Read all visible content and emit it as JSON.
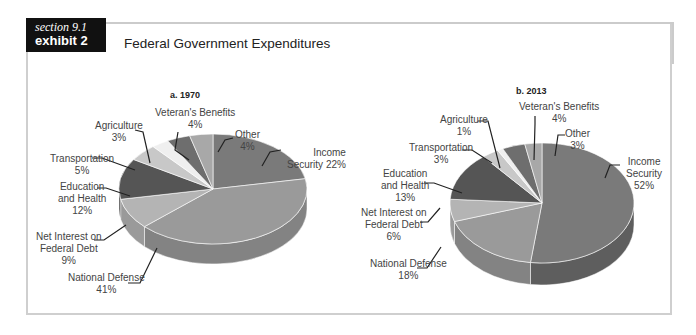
{
  "header": {
    "section": "section 9.1",
    "exhibit": "exhibit 2",
    "title": "Federal Government Expenditures"
  },
  "colors": {
    "header_band": "#cbcbcb",
    "tag_bg": "#111111",
    "frame_border": "#cfcfcf"
  },
  "chart_data": [
    {
      "type": "pie",
      "title": "a. 1970",
      "slices": [
        {
          "label": "Income Security",
          "value": 22,
          "text": "Income Security 22%"
        },
        {
          "label": "National Defense",
          "value": 41,
          "text": "National Defense 41%"
        },
        {
          "label": "Net Interest on Federal Debt",
          "value": 9,
          "text": "Net Interest on Federal Debt 9%"
        },
        {
          "label": "Education and Health",
          "value": 12,
          "text": "Education and Health 12%"
        },
        {
          "label": "Transportation",
          "value": 5,
          "text": "Transportation 5%"
        },
        {
          "label": "Agriculture",
          "value": 3,
          "text": "Agriculture 3%"
        },
        {
          "label": "Veteran's Benefits",
          "value": 4,
          "text": "Veteran's Benefits 4%"
        },
        {
          "label": "Other",
          "value": 4,
          "text": "Other 4%"
        }
      ]
    },
    {
      "type": "pie",
      "title": "b. 2013",
      "slices": [
        {
          "label": "Income Security",
          "value": 52,
          "text": "Income Security 52%"
        },
        {
          "label": "National Defense",
          "value": 18,
          "text": "National Defense 18%"
        },
        {
          "label": "Net Interest on Federal Debt",
          "value": 6,
          "text": "Net Interest on Federal Debt 6%"
        },
        {
          "label": "Education and Health",
          "value": 13,
          "text": "Education and Health 13%"
        },
        {
          "label": "Transportation",
          "value": 3,
          "text": "Transportation 3%"
        },
        {
          "label": "Agriculture",
          "value": 1,
          "text": "Agriculture 1%"
        },
        {
          "label": "Veteran's Benefits",
          "value": 4,
          "text": "Veteran's Benefits 4%"
        },
        {
          "label": "Other",
          "value": 3,
          "text": "Other 3%"
        }
      ]
    }
  ],
  "labels": {
    "a": {
      "title": "a. 1970",
      "veterans": [
        "Veteran's Benefits",
        "4%"
      ],
      "agriculture": [
        "Agriculture",
        "3%"
      ],
      "other": [
        "Other",
        "4%"
      ],
      "income": [
        "Income",
        "Security 22%"
      ],
      "transportation": [
        "Transportation",
        "5%"
      ],
      "education": [
        "Education",
        "and Health",
        "12%"
      ],
      "interest": [
        "Net Interest on",
        "Federal Debt",
        "9%"
      ],
      "defense": [
        "National Defense",
        "41%"
      ]
    },
    "b": {
      "title": "b. 2013",
      "veterans": [
        "Veteran's Benefits",
        "4%"
      ],
      "agriculture": [
        "Agriculture",
        "1%"
      ],
      "other": [
        "Other",
        "3%"
      ],
      "transportation": [
        "Transportation",
        "3%"
      ],
      "income": [
        "Income",
        "Security",
        "52%"
      ],
      "education": [
        "Education",
        "and Health",
        "13%"
      ],
      "interest": [
        "Net Interest on",
        "Federal Debt",
        "6%"
      ],
      "defense": [
        "National Defense",
        "18%"
      ]
    }
  }
}
